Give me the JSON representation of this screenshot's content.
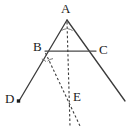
{
  "figure": {
    "type": "euclidean-geometry-diagram",
    "width": 135,
    "height": 128,
    "background_color": "#ffffff",
    "stroke_color": "#3b3b3b",
    "label_color": "#1a1a1a"
  },
  "labels": {
    "a": "A",
    "b": "B",
    "c": "C",
    "d": "D",
    "e": "E"
  },
  "points": {
    "A": {
      "x": 67,
      "y": 20
    },
    "B": {
      "x": 45,
      "y": 51
    },
    "C": {
      "x": 96,
      "y": 51
    },
    "D": {
      "x": 19,
      "y": 101
    },
    "E": {
      "x": 72,
      "y": 97
    }
  },
  "label_positions": {
    "A": {
      "x": 61,
      "y": 2
    },
    "B": {
      "x": 33,
      "y": 40
    },
    "C": {
      "x": 99,
      "y": 43
    },
    "D": {
      "x": 5,
      "y": 92
    },
    "E": {
      "x": 73,
      "y": 90
    }
  },
  "segments": [
    {
      "name": "ray-A-to-D",
      "style": "solid",
      "from": [
        67,
        20
      ],
      "to": [
        19,
        101
      ]
    },
    {
      "name": "ray-A-through-C",
      "style": "solid",
      "from": [
        67,
        20
      ],
      "to": [
        125,
        101
      ]
    },
    {
      "name": "segment-B-to-C",
      "style": "solid",
      "from": [
        45,
        51
      ],
      "to": [
        96,
        51
      ]
    },
    {
      "name": "bisector-from-A",
      "style": "dashed",
      "from": [
        67,
        21
      ],
      "to": [
        70,
        126
      ]
    },
    {
      "name": "bisector-from-B",
      "style": "dashed",
      "from": [
        45,
        52
      ],
      "to": [
        80,
        126
      ]
    }
  ],
  "angle_marks": [
    {
      "name": "angle-mark-a-left",
      "vertex": "A",
      "side": "left"
    },
    {
      "name": "angle-mark-a-right",
      "vertex": "A",
      "side": "right"
    },
    {
      "name": "angle-mark-b-left",
      "vertex": "B",
      "side": "left"
    },
    {
      "name": "angle-mark-b-right",
      "vertex": "B",
      "side": "right"
    }
  ],
  "point_markers": [
    {
      "name": "point-marker-d",
      "x": 18.5,
      "y": 101,
      "shape": "filled-square"
    }
  ]
}
